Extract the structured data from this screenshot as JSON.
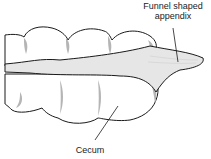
{
  "diagram": {
    "labels": {
      "appendix_line1": "Funnel shaped",
      "appendix_line2": "appendix",
      "cecum": "Cecum"
    },
    "colors": {
      "outline": "#1a1a1a",
      "fill": "#ffffff",
      "band_fill": "#e6e6e6",
      "shadow": "#b5b5b5"
    }
  }
}
